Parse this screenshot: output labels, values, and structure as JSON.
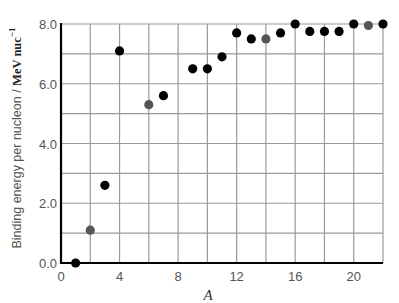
{
  "chart_data": {
    "type": "scatter",
    "title": "",
    "xlabel": "A",
    "ylabel": "Binding energy per nucleon / MeV nuc",
    "ylabel_unit": "MeV nuc",
    "ylabel_unit_exponent": "−1",
    "xlim": [
      0,
      22
    ],
    "ylim": [
      0,
      8
    ],
    "x_ticks": [
      0,
      4,
      8,
      12,
      16,
      20
    ],
    "x_tick_labels": [
      "0",
      "4",
      "8",
      "12",
      "16",
      "20"
    ],
    "y_ticks": [
      0,
      2,
      4,
      6,
      8
    ],
    "y_tick_labels": [
      "0.0",
      "2.0",
      "4.0",
      "6.0",
      "8.0"
    ],
    "grid": true,
    "x_grid_step": 2,
    "y_grid_step": 1,
    "legend": null,
    "colors": {
      "black_point": "#000000",
      "grey_point": "#555555",
      "grid": "#9a9a9a",
      "axis": "#000000"
    },
    "series": [
      {
        "name": "black points",
        "color": "#000000",
        "points": [
          {
            "x": 1,
            "y": 0.0
          },
          {
            "x": 3,
            "y": 2.6
          },
          {
            "x": 4,
            "y": 7.1
          },
          {
            "x": 7,
            "y": 5.6
          },
          {
            "x": 9,
            "y": 6.5
          },
          {
            "x": 10,
            "y": 6.5
          },
          {
            "x": 11,
            "y": 6.9
          },
          {
            "x": 12,
            "y": 7.7
          },
          {
            "x": 13,
            "y": 7.5
          },
          {
            "x": 15,
            "y": 7.7
          },
          {
            "x": 16,
            "y": 8.0
          },
          {
            "x": 17,
            "y": 7.75
          },
          {
            "x": 18,
            "y": 7.75
          },
          {
            "x": 19,
            "y": 7.75
          },
          {
            "x": 20,
            "y": 8.0
          },
          {
            "x": 22,
            "y": 8.0
          }
        ]
      },
      {
        "name": "grey points",
        "color": "#555555",
        "points": [
          {
            "x": 2,
            "y": 1.1
          },
          {
            "x": 6,
            "y": 5.3
          },
          {
            "x": 14,
            "y": 7.5
          },
          {
            "x": 21,
            "y": 7.95
          }
        ]
      }
    ]
  }
}
